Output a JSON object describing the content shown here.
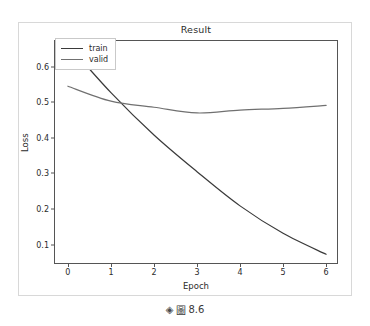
{
  "figure": {
    "caption": {
      "marker_icon": "diamond-icon",
      "marker_glyph": "◈",
      "prefix_glyph": "圖",
      "number": "8.6"
    }
  },
  "chart_data": {
    "type": "line",
    "title": "Result",
    "xlabel": "Epoch",
    "ylabel": "Loss",
    "x": [
      0,
      1,
      2,
      3,
      4,
      5,
      6
    ],
    "xlim": [
      -0.3,
      6.3
    ],
    "ylim": [
      0.043,
      0.672
    ],
    "xticks": [
      "0",
      "1",
      "2",
      "3",
      "4",
      "5",
      "6"
    ],
    "yticks": [
      "0.1",
      "0.2",
      "0.3",
      "0.4",
      "0.5",
      "0.6"
    ],
    "ytick_values": [
      0.1,
      0.2,
      0.3,
      0.4,
      0.5,
      0.6
    ],
    "grid": false,
    "legend_position": "upper left",
    "series": [
      {
        "name": "train",
        "color": "#3a3a3a",
        "values": [
          0.662,
          0.527,
          0.408,
          0.305,
          0.209,
          0.132,
          0.073
        ]
      },
      {
        "name": "valid",
        "color": "#707070",
        "values": [
          0.545,
          0.503,
          0.486,
          0.47,
          0.478,
          0.483,
          0.491
        ]
      }
    ]
  }
}
